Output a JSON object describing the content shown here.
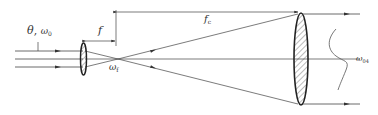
{
  "diagram": {
    "type": "optical beam expander",
    "colors": {
      "line": "#444444",
      "hatch": "#555555",
      "background": "#ffffff"
    },
    "labels": {
      "input_theta": "θ",
      "input_sep": ",",
      "input_omega": "ω",
      "input_omega_sub": "0",
      "focal_short": "f",
      "focal_long": "f",
      "focal_long_sub": "c",
      "waist_focus": "ω",
      "waist_focus_sub": "f",
      "output_waist": "ω",
      "output_waist_sub": "04"
    },
    "elements": [
      {
        "name": "input-lens",
        "kind": "thin lens (small, hatched)"
      },
      {
        "name": "output-lens",
        "kind": "thin lens (large, hatched)"
      },
      {
        "name": "focal-point",
        "kind": "beam crossing point"
      },
      {
        "name": "gaussian-profile",
        "kind": "output beam intensity curve"
      }
    ]
  }
}
